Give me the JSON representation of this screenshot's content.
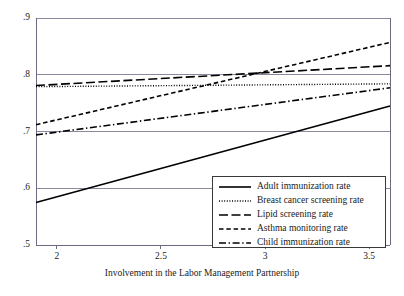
{
  "chart_data": {
    "type": "line",
    "title": "",
    "xlabel": "Involvement in the Labor Management Partnership",
    "ylabel": "",
    "xlim": [
      1.9,
      3.6
    ],
    "ylim": [
      0.5,
      0.9
    ],
    "xticks": [
      2,
      2.5,
      3,
      3.5
    ],
    "xtick_labels": [
      "2",
      "2.5",
      "3",
      "3.5"
    ],
    "yticks": [
      0.5,
      0.6,
      0.7,
      0.8,
      0.9
    ],
    "ytick_labels": [
      ".5",
      ".6",
      ".7",
      ".8",
      ".9"
    ],
    "grid": "horizontal",
    "legend_position": "bottom-right",
    "x": [
      1.9,
      3.6
    ],
    "series": [
      {
        "name": "Adult immunization rate",
        "label": "Adult immunization rate",
        "style": "solid",
        "color": "#000000",
        "values": [
          0.575,
          0.745
        ]
      },
      {
        "name": "Breast cancer screening rate",
        "label": "Breast cancer screening rate",
        "style": "dotted",
        "color": "#000000",
        "values": [
          0.779,
          0.784
        ]
      },
      {
        "name": "Lipid screening rate",
        "label": "Lipid screening rate",
        "style": "long-dash",
        "color": "#000000",
        "values": [
          0.781,
          0.816
        ]
      },
      {
        "name": "Asthma monitoring rate",
        "label": "Asthma monitoring rate",
        "style": "dashed",
        "color": "#000000",
        "values": [
          0.712,
          0.857
        ]
      },
      {
        "name": "Child immunization rate",
        "label": "Child immunization rate",
        "style": "dash-dot",
        "color": "#000000",
        "values": [
          0.694,
          0.777
        ]
      }
    ]
  },
  "axes": {
    "line_color": "#6b6b82",
    "grid_color": "#8a8a9e",
    "background": "#ffffff"
  },
  "legend": {
    "items": [
      "Adult immunization rate",
      "Breast cancer screening rate",
      "Lipid screening rate",
      "Asthma monitoring rate",
      "Child immunization rate"
    ]
  }
}
